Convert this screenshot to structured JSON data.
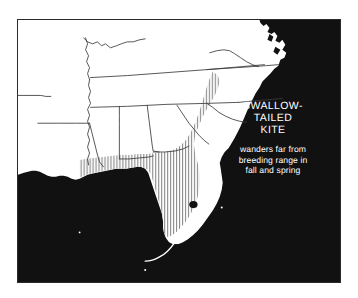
{
  "map": {
    "title": "SWALLOW-TAILED KITE",
    "title_lines": [
      "SWALLOW-",
      "TAILED",
      "KITE"
    ],
    "note": "wanders far from breeding range in fall and spring",
    "note_lines": [
      "wanders far from",
      "breeding range in",
      "fall and spring"
    ],
    "colors": {
      "water": "#111111",
      "land": "#ffffff",
      "border": "#2b2b2b",
      "state_line": "#3a3a3a",
      "label_text": "#ffffff",
      "range_hatch": "#8f8f8f"
    },
    "legend": {
      "range_fill": "vertical-hatch",
      "range_meaning": "breeding range"
    },
    "region": "Southeastern United States",
    "frame": {
      "x": 17,
      "y": 19,
      "width": 324,
      "height": 264
    }
  }
}
